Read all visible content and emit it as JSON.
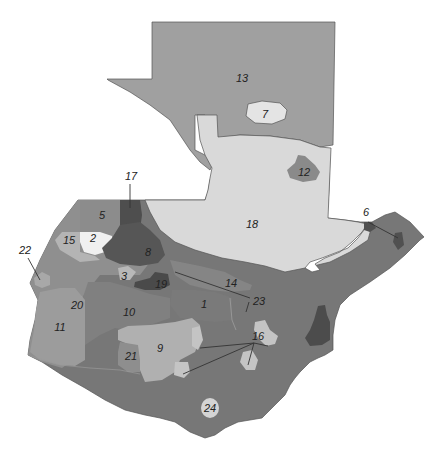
{
  "map": {
    "title": "",
    "colors": {
      "r13": "#a0a0a0",
      "r18": "#d9d9d9",
      "r7": "#e4e4e4",
      "r12": "#8a8a8a",
      "r5": "#8c8c8c",
      "r17": "#4e4e4e",
      "r8": "#565656",
      "r2": "#f0f0f0",
      "r15": "#b4b4b4",
      "r21": "#a8a8a8",
      "r3": "#b8b8b8",
      "r19": "#4a4a4a",
      "r14": "#858585",
      "r1": "#7a7a7a",
      "r23": "#7e7e7e",
      "r10": "#808080",
      "r20": "#cfcfcf",
      "r11": "#9c9c9c",
      "r9": "#b0b0b0",
      "r22": "#8e8e8e",
      "r16": "#c4c4c4",
      "r24": "#727272",
      "r24badge": "#d4d4d4",
      "r6": "#505050",
      "r4": "#4c4c4c",
      "east": "#777777",
      "west": "#8f8f8f",
      "lake": "#ffffff"
    },
    "labels": [
      {
        "id": "1",
        "text": "1"
      },
      {
        "id": "2",
        "text": "2"
      },
      {
        "id": "3",
        "text": "3"
      },
      {
        "id": "5",
        "text": "5"
      },
      {
        "id": "6",
        "text": "6"
      },
      {
        "id": "7",
        "text": "7"
      },
      {
        "id": "8",
        "text": "8"
      },
      {
        "id": "9",
        "text": "9"
      },
      {
        "id": "10",
        "text": "10"
      },
      {
        "id": "11",
        "text": "11"
      },
      {
        "id": "12",
        "text": "12"
      },
      {
        "id": "13",
        "text": "13"
      },
      {
        "id": "14",
        "text": "14"
      },
      {
        "id": "15",
        "text": "15"
      },
      {
        "id": "16",
        "text": "16"
      },
      {
        "id": "17",
        "text": "17"
      },
      {
        "id": "18",
        "text": "18"
      },
      {
        "id": "19",
        "text": "19"
      },
      {
        "id": "20",
        "text": "20"
      },
      {
        "id": "21",
        "text": "21"
      },
      {
        "id": "22",
        "text": "22"
      },
      {
        "id": "23",
        "text": "23"
      },
      {
        "id": "24",
        "text": "24"
      }
    ]
  }
}
